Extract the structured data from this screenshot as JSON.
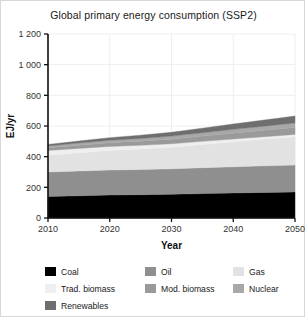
{
  "figure": {
    "title": "Global primary energy consumption (SSP2)",
    "background": "#ffffff",
    "border_color": "#d8d8d8"
  },
  "chart_data": {
    "type": "area",
    "stacked": true,
    "title": "Global primary energy consumption (SSP2)",
    "xlabel": "Year",
    "ylabel": "EJ/yr",
    "x": [
      2010,
      2015,
      2020,
      2025,
      2030,
      2035,
      2040,
      2045,
      2050
    ],
    "xlim": [
      2010,
      2050
    ],
    "ylim": [
      0,
      1200
    ],
    "xticks": [
      2010,
      2020,
      2030,
      2040,
      2050
    ],
    "xtick_labels": [
      "2010",
      "2020",
      "2030",
      "2040",
      "2050"
    ],
    "yticks": [
      0,
      200,
      400,
      600,
      800,
      1000,
      1200
    ],
    "ytick_labels": [
      "0",
      "200",
      "400",
      "600",
      "800",
      "1 000",
      "1 200"
    ],
    "grid": true,
    "legend_position": "below",
    "series": [
      {
        "name": "Coal",
        "color": "#000000",
        "values": [
          140,
          145,
          150,
          152,
          155,
          159,
          163,
          167,
          170
        ]
      },
      {
        "name": "Oil",
        "color": "#8f8f8f",
        "values": [
          160,
          162,
          163,
          164,
          166,
          169,
          171,
          173,
          175
        ]
      },
      {
        "name": "Gas",
        "color": "#e2e2e2",
        "values": [
          110,
          119,
          128,
          134,
          141,
          152,
          163,
          174,
          185
        ]
      },
      {
        "name": "Trad. biomass",
        "color": "#efefef",
        "values": [
          30,
          28,
          26,
          24,
          22,
          20,
          18,
          16,
          15
        ]
      },
      {
        "name": "Mod. biomass",
        "color": "#9a9a9a",
        "values": [
          18,
          21,
          24,
          27,
          30,
          34,
          38,
          42,
          45
        ]
      },
      {
        "name": "Nuclear",
        "color": "#a8a8a8",
        "values": [
          12,
          14,
          16,
          18,
          20,
          22,
          25,
          27,
          30
        ]
      },
      {
        "name": "Renewables",
        "color": "#6e6e6e",
        "values": [
          10,
          13,
          17,
          21,
          25,
          30,
          35,
          40,
          45
        ]
      }
    ],
    "totals": [
      480,
      502,
      524,
      540,
      559,
      586,
      613,
      639,
      665
    ]
  },
  "legend": {
    "items": [
      {
        "label": "Coal",
        "color": "#000000"
      },
      {
        "label": "Oil",
        "color": "#8f8f8f"
      },
      {
        "label": "Gas",
        "color": "#e2e2e2"
      },
      {
        "label": "Trad. biomass",
        "color": "#efefef"
      },
      {
        "label": "Mod. biomass",
        "color": "#9a9a9a"
      },
      {
        "label": "Nuclear",
        "color": "#a8a8a8"
      },
      {
        "label": "Renewables",
        "color": "#6e6e6e"
      }
    ]
  }
}
